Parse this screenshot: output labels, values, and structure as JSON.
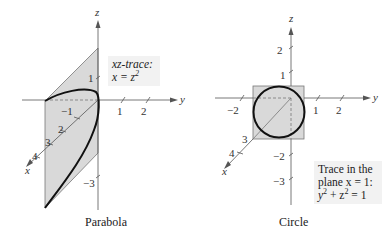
{
  "figures": [
    {
      "caption": "Parabola",
      "axis_labels": {
        "z": "z",
        "y": "y",
        "x": "x"
      },
      "z_ticks": [
        "1",
        "−3"
      ],
      "y_ticks": [
        "−1",
        "1",
        "2"
      ],
      "x_ticks": [
        "2",
        "3",
        "4"
      ],
      "annotation": {
        "line1": "xz-trace:",
        "line2_lhs": "x = z",
        "line2_exp": "2"
      },
      "colors": {
        "shade": "#d9d9d9",
        "curve": "#111111",
        "axis": "#555555"
      }
    },
    {
      "caption": "Circle",
      "axis_labels": {
        "z": "z",
        "y": "y",
        "x": "x"
      },
      "z_ticks": [
        "2",
        "1",
        "−2",
        "−3"
      ],
      "y_ticks": [
        "−2",
        "1",
        "2"
      ],
      "x_ticks": [
        "3",
        "4"
      ],
      "annotation": {
        "line1": "Trace in the",
        "line2": "plane x = 1:",
        "line3_a": "y",
        "line3_b": "2",
        "line3_c": " + z",
        "line3_d": "2",
        "line3_e": " = 1"
      },
      "colors": {
        "shade": "#d9d9d9",
        "curve": "#111111",
        "axis": "#555555"
      }
    }
  ]
}
